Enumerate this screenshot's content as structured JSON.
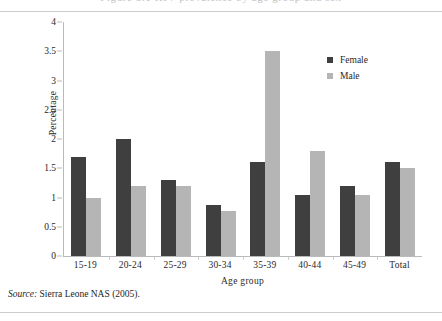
{
  "clipped_caption": "Figure 5.1  HIV prevalence by age group and sex",
  "chart_data": {
    "type": "bar",
    "title": "",
    "xlabel": "Age group",
    "ylabel": "Percentage",
    "categories": [
      "15-19",
      "20-24",
      "25-29",
      "30-34",
      "35-39",
      "40-44",
      "45-49",
      "Total"
    ],
    "series": [
      {
        "name": "Female",
        "color": "#3f3f3f",
        "values": [
          1.7,
          2.0,
          1.3,
          0.87,
          1.6,
          1.05,
          1.2,
          1.6
        ]
      },
      {
        "name": "Male",
        "color": "#b5b5b5",
        "values": [
          1.0,
          1.2,
          1.2,
          0.77,
          3.5,
          1.8,
          1.05,
          1.5
        ]
      }
    ],
    "ylim": [
      0,
      4
    ],
    "ytick_labels": [
      "4",
      "3.5",
      "3",
      "2.5",
      "2",
      "1.5",
      "1",
      "0.5",
      "0"
    ],
    "ytick_values": [
      4,
      3.5,
      3,
      2.5,
      2,
      1.5,
      1,
      0.5,
      0
    ],
    "grid": false,
    "legend_position": "top-right"
  },
  "legend": {
    "items": [
      {
        "label": "Female",
        "swatch": "sw-f"
      },
      {
        "label": "Male",
        "swatch": "sw-m"
      }
    ]
  },
  "source": {
    "prefix": "Source:",
    "text": " Sierra Leone NAS (2005)."
  }
}
